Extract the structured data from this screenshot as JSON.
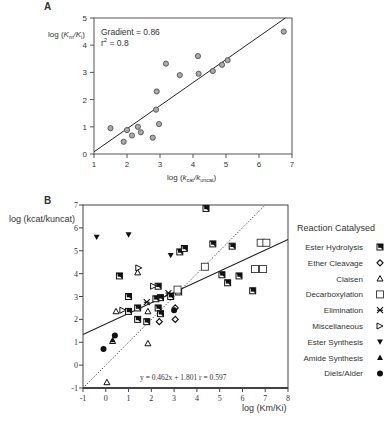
{
  "chart_data": [
    {
      "panel": "A",
      "type": "scatter",
      "title": "",
      "xlabel": "log (kcat/kuncat)",
      "ylabel": "log (Km/Ki)",
      "xlim": [
        1,
        7
      ],
      "ylim": [
        0,
        5
      ],
      "xticks": [
        1,
        2,
        3,
        4,
        5,
        6,
        7
      ],
      "yticks": [
        0,
        1,
        2,
        3,
        4,
        5
      ],
      "grid": false,
      "annotations": [
        "Gradient = 0.86",
        "r2 = 0.8"
      ],
      "fit_line": {
        "x1": 1,
        "y1": 0.08,
        "x2": 6.8,
        "y2": 5.0
      },
      "points": [
        {
          "x": 1.5,
          "y": 0.95
        },
        {
          "x": 1.9,
          "y": 0.45
        },
        {
          "x": 2.0,
          "y": 0.88
        },
        {
          "x": 2.15,
          "y": 0.68
        },
        {
          "x": 2.33,
          "y": 1.0
        },
        {
          "x": 2.42,
          "y": 0.8
        },
        {
          "x": 2.78,
          "y": 0.6
        },
        {
          "x": 2.88,
          "y": 1.63
        },
        {
          "x": 2.9,
          "y": 2.3
        },
        {
          "x": 2.97,
          "y": 1.1
        },
        {
          "x": 3.18,
          "y": 3.32
        },
        {
          "x": 3.6,
          "y": 2.9
        },
        {
          "x": 4.15,
          "y": 3.6
        },
        {
          "x": 4.17,
          "y": 2.95
        },
        {
          "x": 4.6,
          "y": 3.05
        },
        {
          "x": 4.88,
          "y": 3.28
        },
        {
          "x": 5.05,
          "y": 3.45
        },
        {
          "x": 6.75,
          "y": 4.5
        }
      ]
    },
    {
      "panel": "B",
      "type": "scatter",
      "title": "",
      "xlabel": "log (Km/Ki)",
      "ylabel": "log (kcat/kuncat)",
      "xlim": [
        -1,
        8
      ],
      "ylim": [
        -1,
        7
      ],
      "xticks": [
        -1,
        0,
        1,
        2,
        3,
        4,
        5,
        6,
        7,
        8
      ],
      "yticks": [
        -1,
        0,
        1,
        2,
        3,
        4,
        5,
        6,
        7
      ],
      "grid": false,
      "legend_title": "Reaction Catalysed",
      "legend_position": "right",
      "annotation": "y = 0.462x + 1.801   r = 0.597",
      "fit_line": {
        "slope": 0.462,
        "intercept": 1.801,
        "style": "solid"
      },
      "identity_line": {
        "x1": -1,
        "y1": -1,
        "x2": 7,
        "y2": 7,
        "style": "dotted"
      },
      "series": [
        {
          "name": "Ester Hydrolysis",
          "marker": "half-filled-square",
          "points": [
            [
              4.4,
              6.85
            ],
            [
              0.6,
              3.9
            ],
            [
              1.0,
              3.0
            ],
            [
              1.4,
              2.5
            ],
            [
              1.4,
              2.0
            ],
            [
              2.3,
              3.45
            ],
            [
              2.3,
              2.5
            ],
            [
              2.4,
              2.95
            ],
            [
              2.4,
              2.25
            ],
            [
              2.2,
              2.9
            ],
            [
              2.85,
              3.0
            ],
            [
              3.2,
              3.2
            ],
            [
              3.25,
              4.95
            ],
            [
              3.45,
              5.1
            ],
            [
              4.7,
              5.3
            ],
            [
              5.55,
              5.2
            ],
            [
              5.1,
              3.95
            ],
            [
              5.35,
              3.6
            ],
            [
              5.85,
              3.9
            ],
            [
              6.45,
              3.25
            ],
            [
              1.8,
              1.9
            ],
            [
              1.0,
              2.35
            ]
          ]
        },
        {
          "name": "Ether Cleavage",
          "marker": "diamond-open",
          "points": [
            [
              2.35,
              1.9
            ],
            [
              3.05,
              2.0
            ],
            [
              3.05,
              2.5
            ]
          ]
        },
        {
          "name": "Claisen",
          "marker": "triangle-open",
          "points": [
            [
              0.45,
              2.35
            ],
            [
              1.85,
              2.35
            ],
            [
              0.3,
              1.05
            ],
            [
              1.85,
              0.95
            ],
            [
              1.4,
              4.05
            ],
            [
              0.05,
              -0.75
            ]
          ]
        },
        {
          "name": "Decarboxylation",
          "marker": "square-open",
          "points": [
            [
              4.35,
              4.3
            ],
            [
              6.8,
              5.35
            ],
            [
              7.05,
              5.35
            ],
            [
              6.55,
              4.2
            ],
            [
              6.9,
              4.2
            ],
            [
              3.15,
              3.3
            ]
          ]
        },
        {
          "name": "Elimination",
          "marker": "asterisk-square",
          "points": [
            [
              1.8,
              2.75
            ],
            [
              2.75,
              3.15
            ]
          ]
        },
        {
          "name": "Miscellaneous",
          "marker": "triangle-right-open",
          "points": [
            [
              0.75,
              2.4
            ],
            [
              2.1,
              3.45
            ],
            [
              1.45,
              4.25
            ]
          ]
        },
        {
          "name": "Ester Synthesis",
          "marker": "triangle-down-filled",
          "points": [
            [
              -0.4,
              5.6
            ],
            [
              1.0,
              5.7
            ],
            [
              2.85,
              4.8
            ]
          ]
        },
        {
          "name": "Amide Synthesis",
          "marker": "triangle-up-filled",
          "points": [
            [
              0.3,
              1.1
            ]
          ]
        },
        {
          "name": "Diels/Alder",
          "marker": "circle-filled",
          "points": [
            [
              0.4,
              1.3
            ],
            [
              -0.1,
              0.7
            ],
            [
              3.0,
              2.4
            ]
          ]
        }
      ]
    }
  ],
  "panels": {
    "a": {
      "label": "A",
      "gradient": "Gradient = 0.86",
      "r2": "r",
      "r2_sup": "2",
      "r2_val": " = 0.8",
      "xlabel_prefix": "log (",
      "xlabel_k1": "k",
      "xlabel_sub1": "cat",
      "xlabel_k2": "/k",
      "xlabel_sub2": "uncat",
      "xlabel_suffix": ")",
      "ylabel_prefix": "log (",
      "ylabel_k1": "K",
      "ylabel_sub1": "m",
      "ylabel_k2": "/K",
      "ylabel_sub2": "i",
      "ylabel_suffix": ")"
    },
    "b": {
      "label": "B",
      "ylabel": "log (kcat/kuncat)",
      "xlabel": "log (Km/Ki)",
      "equation": "y = 0.462x + 1.801   r = 0.597",
      "legend_title": "Reaction Catalysed"
    }
  }
}
